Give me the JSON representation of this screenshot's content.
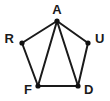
{
  "diagram": {
    "type": "undirected-graph",
    "title": "",
    "background_color": "#ffffff",
    "edge_color": "#1a1a1a",
    "vertex_color": "#111111",
    "label_color": "#1a1a1a",
    "edge_width": 2,
    "vertex_radius": 2.6,
    "shape": "pentagon-with-two-diagonals",
    "vertices": [
      {
        "id": "A",
        "label": "A",
        "x": 57,
        "y": 21,
        "label_x": 57,
        "label_y": 11,
        "label_anchor": "middle"
      },
      {
        "id": "R",
        "label": "R",
        "x": 22,
        "y": 43,
        "label_x": 14,
        "label_y": 40,
        "label_anchor": "end"
      },
      {
        "id": "U",
        "label": "U",
        "x": 88,
        "y": 43,
        "label_x": 95,
        "label_y": 40,
        "label_anchor": "start"
      },
      {
        "id": "F",
        "label": "F",
        "x": 38,
        "y": 86,
        "label_x": 32,
        "label_y": 91,
        "label_anchor": "end"
      },
      {
        "id": "D",
        "label": "D",
        "x": 78,
        "y": 86,
        "label_x": 84,
        "label_y": 91,
        "label_anchor": "start"
      }
    ],
    "edges": [
      {
        "id": "A-R",
        "from": "A",
        "to": "R",
        "kind": "perimeter"
      },
      {
        "id": "R-F",
        "from": "R",
        "to": "F",
        "kind": "perimeter"
      },
      {
        "id": "F-D",
        "from": "F",
        "to": "D",
        "kind": "perimeter"
      },
      {
        "id": "D-U",
        "from": "D",
        "to": "U",
        "kind": "perimeter"
      },
      {
        "id": "U-A",
        "from": "U",
        "to": "A",
        "kind": "perimeter"
      },
      {
        "id": "A-F",
        "from": "A",
        "to": "F",
        "kind": "diagonal"
      },
      {
        "id": "A-D",
        "from": "A",
        "to": "D",
        "kind": "diagonal"
      }
    ]
  }
}
